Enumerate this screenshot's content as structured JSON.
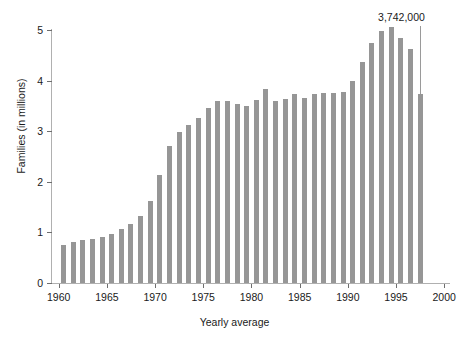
{
  "chart_data": {
    "type": "bar",
    "title": "",
    "subtitle": "",
    "xlabel": "Yearly average",
    "ylabel": "Families (in millions)",
    "xlim": [
      1959.2,
      2000.6
    ],
    "ylim": [
      0,
      5
    ],
    "y_ticks": [
      0,
      1,
      2,
      3,
      4,
      5
    ],
    "y_tick_labels": [
      "0",
      "1",
      "2",
      "3",
      "4",
      "5"
    ],
    "x_ticks": [
      1960,
      1965,
      1970,
      1975,
      1980,
      1985,
      1990,
      1995,
      2000
    ],
    "x_tick_labels": [
      "1960",
      "1965",
      "1970",
      "1975",
      "1980",
      "1985",
      "1990",
      "1995",
      "2000"
    ],
    "grid": false,
    "legend": "none",
    "bar_color": "#969696",
    "axis_color": "#b0b0b0",
    "categories": [
      "1960",
      "1961",
      "1962",
      "1963",
      "1964",
      "1965",
      "1966",
      "1967",
      "1968",
      "1969",
      "1970",
      "1971",
      "1972",
      "1973",
      "1974",
      "1975",
      "1976",
      "1977",
      "1978",
      "1979",
      "1980",
      "1981",
      "1982",
      "1983",
      "1984",
      "1985",
      "1986",
      "1987",
      "1988",
      "1989",
      "1990",
      "1991",
      "1992",
      "1993",
      "1994",
      "1995",
      "1996",
      "1997"
    ],
    "values": [
      0.75,
      0.81,
      0.85,
      0.86,
      0.9,
      0.96,
      1.06,
      1.17,
      1.33,
      1.63,
      2.14,
      2.7,
      2.98,
      3.12,
      3.26,
      3.46,
      3.6,
      3.6,
      3.53,
      3.49,
      3.62,
      3.84,
      3.6,
      3.63,
      3.74,
      3.65,
      3.73,
      3.75,
      3.75,
      3.77,
      4.0,
      4.36,
      4.75,
      4.98,
      5.05,
      4.85,
      4.63,
      3.74
    ],
    "annotations": [
      {
        "text": "3,742,000",
        "points_to_category": "1997",
        "points_to_value": 3.742
      }
    ]
  },
  "annotation": {
    "label": "3,742,000"
  },
  "axes": {
    "x_title": "Yearly average",
    "y_title": "Families (in millions)"
  }
}
